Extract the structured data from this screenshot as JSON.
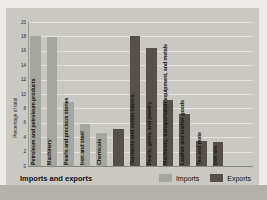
{
  "chart_data": {
    "type": "bar",
    "title": "Imports and exports",
    "ylabel": "Percentage of total",
    "ylim": [
      0,
      20
    ],
    "ytick_step": 2,
    "yticks": [
      0,
      2,
      4,
      6,
      8,
      10,
      12,
      14,
      16,
      18,
      20
    ],
    "grid": "horizontal",
    "legend_position": "bottom-right",
    "legend": [
      {
        "label": "Imports",
        "color": "#a5a79e"
      },
      {
        "label": "Exports",
        "color": "#57504a"
      }
    ],
    "bars": [
      {
        "label": "Petroleum and petroleum products",
        "series": "Imports",
        "value": 18.1
      },
      {
        "label": "Machinery",
        "series": "Imports",
        "value": 17.9
      },
      {
        "label": "Pearls and precious stones",
        "series": "Imports",
        "value": 8.9
      },
      {
        "label": "Iron and steel",
        "series": "Imports",
        "value": 5.8
      },
      {
        "label": "Chemicals",
        "series": "Imports",
        "value": 4.6
      },
      {
        "label": "",
        "series": "Exports",
        "value": 5.1
      },
      {
        "label": "Garments and cotton fabrics",
        "series": "Exports",
        "value": 18.1
      },
      {
        "label": "Pearls, gems, and jewelry",
        "series": "Exports",
        "value": 16.4
      },
      {
        "label": "Machinery, transportation equipment, and metals",
        "series": "Exports",
        "value": 9.1
      },
      {
        "label": "Leather and leather goods",
        "series": "Exports",
        "value": 7.2
      },
      {
        "label": "Tea and mate",
        "series": "Exports",
        "value": 3.5
      },
      {
        "label": "Iron ore",
        "series": "Exports",
        "value": 3.4
      }
    ]
  },
  "colors": {
    "panel_background": "#c9c8c3",
    "page_background": "#ecebe7",
    "bottom_band": "#b2b1ab",
    "gridline": "#e3e2dd",
    "text": "#161614"
  }
}
